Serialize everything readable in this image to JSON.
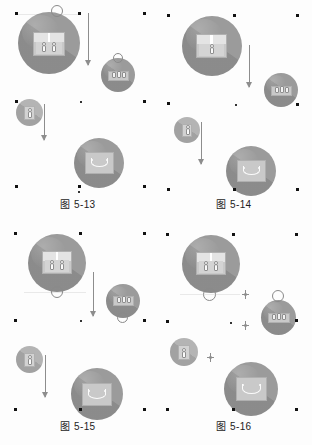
{
  "document": {
    "kind": "figure-sheet",
    "background_color": "#fdfdfd",
    "width": 312,
    "height": 445
  },
  "palette": {
    "disc_gray": "#9b9b9b",
    "box_gray": "#c9c9c9",
    "box_flap": "#e4e4e4",
    "arrow_gray": "#8d8d8d",
    "handle_black": "#121212",
    "caption_text": "#1c1c1c"
  },
  "panels": [
    {
      "id": "fig-5-13",
      "caption": "图 5-13",
      "nodes": [
        {
          "name": "source-box-circle",
          "content": "open-box-with-figures",
          "size": "large",
          "has_ring": true
        },
        {
          "name": "goods-circle",
          "content": "stacked-rolls",
          "size": "small",
          "has_ring": true
        },
        {
          "name": "person-circle",
          "content": "standing-figure",
          "size": "x-small",
          "has_ring": false
        },
        {
          "name": "destination-box-circle",
          "content": "open-box-v-shape",
          "size": "medium",
          "has_ring": false
        }
      ],
      "connectors": [
        {
          "name": "flow-arrow-top",
          "direction": "down",
          "style": "long-arrow"
        },
        {
          "name": "flow-arrow-bottom",
          "direction": "down",
          "style": "long-arrow"
        }
      ]
    },
    {
      "id": "fig-5-14",
      "caption": "图 5-14",
      "nodes": [
        {
          "name": "source-box-circle",
          "content": "open-box-with-figures",
          "size": "large",
          "has_ring": false
        },
        {
          "name": "goods-circle",
          "content": "stacked-rolls",
          "size": "small",
          "has_ring": false
        },
        {
          "name": "person-circle",
          "content": "standing-figure",
          "size": "x-small",
          "has_ring": false
        },
        {
          "name": "destination-box-circle",
          "content": "open-box-v-shape",
          "size": "medium",
          "has_ring": false
        }
      ],
      "connectors": [
        {
          "name": "flow-arrow-top",
          "direction": "down",
          "style": "long-arrow"
        },
        {
          "name": "flow-arrow-bottom",
          "direction": "down",
          "style": "long-arrow"
        }
      ]
    },
    {
      "id": "fig-5-15",
      "caption": "图 5-15",
      "nodes": [
        {
          "name": "source-box-circle",
          "content": "open-box-with-figures",
          "size": "large",
          "has_ring": true
        },
        {
          "name": "goods-circle",
          "content": "stacked-rolls",
          "size": "small",
          "has_ring": true
        },
        {
          "name": "person-circle",
          "content": "standing-figure",
          "size": "x-small",
          "has_ring": false
        },
        {
          "name": "destination-box-circle",
          "content": "open-box-v-shape",
          "size": "medium",
          "has_ring": false
        }
      ],
      "connectors": [
        {
          "name": "flow-arrow-top",
          "direction": "down",
          "style": "long-arrow"
        },
        {
          "name": "flow-arrow-bottom",
          "direction": "down",
          "style": "long-arrow"
        }
      ]
    },
    {
      "id": "fig-5-16",
      "caption": "图 5-16",
      "nodes": [
        {
          "name": "source-box-circle",
          "content": "open-box-with-figures",
          "size": "large",
          "has_ring": true
        },
        {
          "name": "goods-circle",
          "content": "stacked-rolls",
          "size": "small",
          "has_ring": true
        },
        {
          "name": "person-circle",
          "content": "standing-figure",
          "size": "x-small",
          "has_ring": false
        },
        {
          "name": "destination-box-circle",
          "content": "open-box-v-shape",
          "size": "medium",
          "has_ring": false
        }
      ],
      "connectors": [
        {
          "name": "flow-marker-1",
          "direction": "down",
          "style": "star-marker"
        },
        {
          "name": "flow-marker-2",
          "direction": "down",
          "style": "star-marker"
        },
        {
          "name": "flow-marker-3",
          "direction": "down",
          "style": "star-marker"
        }
      ]
    }
  ]
}
